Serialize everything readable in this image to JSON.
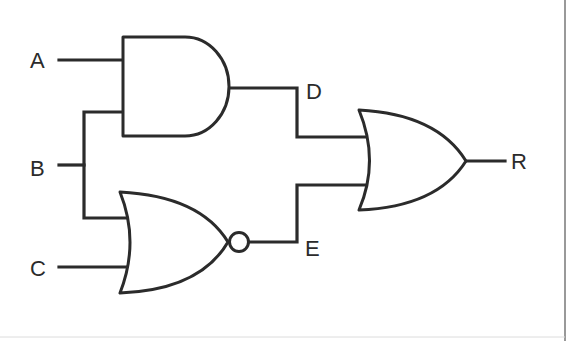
{
  "diagram": {
    "type": "logic-circuit",
    "inputs": [
      {
        "id": "A",
        "label": "A"
      },
      {
        "id": "B",
        "label": "B"
      },
      {
        "id": "C",
        "label": "C"
      }
    ],
    "intermediate": [
      {
        "id": "D",
        "label": "D"
      },
      {
        "id": "E",
        "label": "E"
      }
    ],
    "output": {
      "id": "R",
      "label": "R"
    },
    "gates": [
      {
        "id": "gate1",
        "type": "AND",
        "inputs": [
          "A",
          "B"
        ],
        "output": "D"
      },
      {
        "id": "gate2",
        "type": "NOR",
        "inputs": [
          "B",
          "C"
        ],
        "output": "E"
      },
      {
        "id": "gate3",
        "type": "OR",
        "inputs": [
          "D",
          "E"
        ],
        "output": "R"
      }
    ],
    "colors": {
      "line": "#2b2b2b",
      "background": "#ffffff"
    }
  }
}
